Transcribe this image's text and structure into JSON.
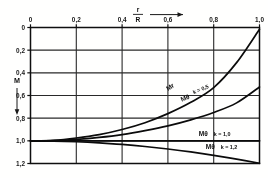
{
  "figure": {
    "kind": "engineering-chart",
    "background_color": "#fdfdfc",
    "ink_color": "#1a1a1a"
  },
  "chart_data": {
    "type": "line",
    "title": "",
    "xlabel": "r / R",
    "ylabel": "M",
    "x_axis": {
      "position": "top",
      "ticks": [
        0,
        0.2,
        0.4,
        0.6,
        0.8,
        1.0
      ],
      "tick_labels": [
        "0",
        "0,2",
        "0,4",
        "0,6",
        "0,8",
        "1,0"
      ],
      "xlim": [
        0,
        1.0
      ],
      "arrow_label": "r/R",
      "arrow_direction": "right",
      "numerator": "r",
      "denominator": "R"
    },
    "y_axis": {
      "position": "left",
      "inverted": true,
      "ticks": [
        0,
        0.2,
        0.4,
        0.6,
        0.8,
        1.0,
        1.2
      ],
      "tick_labels": [
        "0",
        "0,2",
        "0,4",
        "0,6",
        "0,8",
        "1,0",
        "1,2"
      ],
      "ylim": [
        0,
        1.2
      ],
      "axis_label": "M",
      "arrow_direction": "down"
    },
    "grid": true,
    "legend": "inline-annotations",
    "x": [
      0.0,
      0.1,
      0.2,
      0.3,
      0.4,
      0.5,
      0.6,
      0.7,
      0.8,
      0.9,
      1.0
    ],
    "series": [
      {
        "name": "Mr",
        "label": "Mr",
        "k": null,
        "label_x": 0.6,
        "label_y": 0.56,
        "values": [
          1.0,
          0.995,
          0.975,
          0.945,
          0.9,
          0.84,
          0.76,
          0.66,
          0.53,
          0.31,
          0.015
        ]
      },
      {
        "name": "M-theta-k05",
        "label": "Mθ",
        "k": "k = 0,5",
        "label_x": 0.66,
        "label_y": 0.655,
        "values": [
          1.0,
          0.998,
          0.988,
          0.97,
          0.945,
          0.91,
          0.868,
          0.815,
          0.75,
          0.665,
          0.525
        ]
      },
      {
        "name": "M-theta-k10",
        "label": "Mθ",
        "k": "k = 1,0",
        "label_x": 0.735,
        "label_y": 0.955,
        "values": [
          1.0,
          1.0,
          1.0,
          1.0,
          1.0,
          1.0,
          1.0,
          1.0,
          1.0,
          1.0,
          1.0
        ]
      },
      {
        "name": "M-theta-k12",
        "label": "Mθ",
        "k": "k = 1,2",
        "label_x": 0.765,
        "label_y": 1.075,
        "values": [
          1.0,
          1.002,
          1.008,
          1.018,
          1.032,
          1.05,
          1.072,
          1.098,
          1.128,
          1.162,
          1.198
        ]
      }
    ]
  }
}
